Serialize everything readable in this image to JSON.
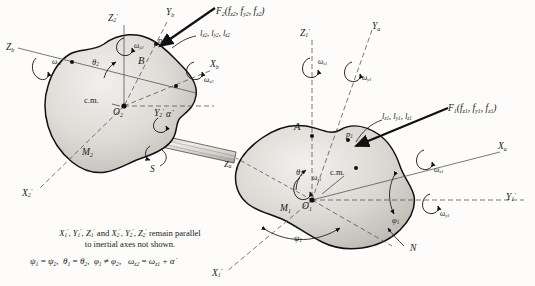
{
  "figure": {
    "type": "rigid-body-dynamics-diagram"
  },
  "bodies": {
    "left": {
      "body_letter": "B",
      "mass_label": "M",
      "mass_sub": "2",
      "cm_label": "c.m.",
      "origin": "O",
      "origin_sub": "2",
      "contact_point": "p",
      "contact_point_sub": "2"
    },
    "right": {
      "body_letter": "A",
      "mass_label": "M",
      "mass_sub": "1",
      "cm_label": "c.m.",
      "origin": "O",
      "origin_sub": "1",
      "contact_point": "p",
      "contact_point_sub": "1"
    }
  },
  "axes": {
    "left_primed": [
      {
        "name": "Z",
        "sub": "2",
        "primed": true
      },
      {
        "name": "Y",
        "sub": "2",
        "primed": true
      },
      {
        "name": "X",
        "sub": "2",
        "primed": true
      }
    ],
    "left_body": [
      {
        "name": "Z",
        "sub": "b",
        "primed": false
      },
      {
        "name": "Y",
        "sub": "b",
        "primed": false
      },
      {
        "name": "X",
        "sub": "b",
        "primed": false
      }
    ],
    "right_primed": [
      {
        "name": "Z",
        "sub": "1",
        "primed": true
      },
      {
        "name": "Y",
        "sub": "1",
        "primed": true
      },
      {
        "name": "X",
        "sub": "1",
        "primed": true
      }
    ],
    "right_body": [
      {
        "name": "Z",
        "sub": "a",
        "primed": false
      },
      {
        "name": "Y",
        "sub": "a",
        "primed": false
      },
      {
        "name": "X",
        "sub": "a",
        "primed": false
      }
    ]
  },
  "angular_rates": {
    "left": [
      {
        "symbol": "ω",
        "sub": "z2"
      },
      {
        "symbol": "ω",
        "sub": "y2"
      },
      {
        "symbol": "ω",
        "sub": "x2"
      }
    ],
    "right": [
      {
        "symbol": "ω",
        "sub": "z1"
      },
      {
        "symbol": "ω",
        "sub": "y1"
      },
      {
        "symbol": "ω",
        "sub": "x1"
      },
      {
        "symbol": "ω",
        "sub": "y1b"
      }
    ]
  },
  "euler_angles": {
    "left": [
      {
        "symbol": "θ",
        "sub": "2"
      }
    ],
    "right": [
      {
        "symbol": "θ",
        "sub": "1"
      },
      {
        "symbol": "ψ",
        "sub": "1"
      },
      {
        "symbol": "φ",
        "sub": "1"
      }
    ],
    "node_line": "N"
  },
  "force_left": {
    "vector": "F",
    "vector_sub": "2",
    "components": "(f",
    "comp_x": "x2",
    "comp_y": "y2",
    "comp_z": "z2",
    "full": "F2(fx2, fy2, fz2)"
  },
  "moment_left": {
    "l1": "l",
    "l1s": "x2",
    "l2": "l",
    "l2s": "y2",
    "l3": "l",
    "l3s": "z2",
    "full": "lx2, ly2, lz2"
  },
  "force_right": {
    "vector": "F",
    "vector_sub": "1",
    "full": "F1(fx1, fy1, fz1)"
  },
  "moment_right": {
    "full": "lx1, ly1, lz1"
  },
  "shaft": {
    "label": "S",
    "rate_symbol": "α̇"
  },
  "caption": {
    "line1_pre": "X",
    "line1": "X′₁, Y′₁, Z′₁ and X′₂, Y′₂, Z′₂ remain parallel",
    "line2": "to inertial axes not shown."
  },
  "relations": {
    "text": "ψ₁ = ψ₂,  θ₁ = θ₂,  φ₁ ≠ φ₂,  ω_z2 = ω_z1 + α̇"
  },
  "colors": {
    "body_fill_light": "#e8e6e2",
    "body_fill_mid": "#cfccc6",
    "outline": "#1a1a1a",
    "paper": "#fdfcfa"
  }
}
